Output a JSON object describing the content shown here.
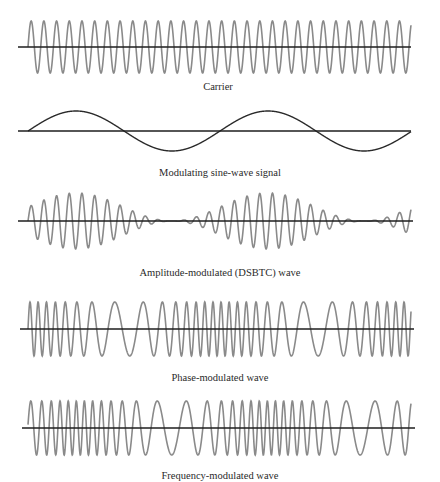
{
  "figure": {
    "captions": {
      "carrier": "Carrier",
      "modulating": "Modulating sine-wave signal",
      "am": "Amplitude-modulated (DSBTC) wave",
      "pm": "Phase-modulated wave",
      "fm": "Frequency-modulated wave"
    },
    "colors": {
      "wave": "#8a8a8a",
      "axis": "#1e1e1e",
      "background": "#ffffff"
    }
  },
  "chart_data": {
    "type": "line",
    "title": "",
    "x_start": 28,
    "x_end": 411,
    "carrier_period_px": 12.7,
    "modulating_period_px": 192,
    "panels": [
      {
        "id": "carrier",
        "name": "Carrier",
        "kind": "carrier",
        "axis_y": 47,
        "amplitude": 26,
        "axis_x": [
          18,
          411
        ]
      },
      {
        "id": "modulating",
        "name": "Modulating sine-wave signal",
        "kind": "modulating",
        "axis_y": 131,
        "amplitude": 20,
        "axis_x": [
          18,
          411
        ]
      },
      {
        "id": "am",
        "name": "Amplitude-modulated (DSBTC) wave",
        "kind": "am",
        "axis_y": 221,
        "amplitude": 28,
        "modulation_index": 1.0,
        "axis_x": [
          18,
          413
        ]
      },
      {
        "id": "pm",
        "name": "Phase-modulated wave",
        "kind": "pm",
        "axis_y": 329,
        "amplitude": 27,
        "phase_deviation_rad": 8.8,
        "axis_x": [
          20,
          414
        ]
      },
      {
        "id": "fm",
        "name": "Frequency-modulated wave",
        "kind": "fm",
        "axis_y": 428,
        "amplitude": 27,
        "freq_deviation_per_px": 0.046,
        "axis_x": [
          22,
          415
        ]
      }
    ],
    "xlabel": "",
    "ylabel": "",
    "grid": false,
    "legend": "none"
  }
}
